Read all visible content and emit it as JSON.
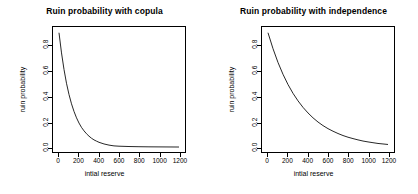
{
  "figure": {
    "background": "#ffffff",
    "line_color": "#000000",
    "axis_color": "#000000"
  },
  "chart_data": [
    {
      "type": "line",
      "title": "Ruin probability with copula",
      "xlabel": "intial reserve",
      "ylabel": "ruin probability",
      "xlim": [
        -60,
        1260
      ],
      "ylim": [
        -0.035,
        0.945
      ],
      "grid": false,
      "legend": null,
      "xticks": [
        0,
        200,
        400,
        600,
        800,
        1000,
        1200
      ],
      "xticklabels": [
        "0",
        "200",
        "400",
        "600",
        "800",
        "1000",
        "1200"
      ],
      "yticks": [
        0.0,
        0.2,
        0.4,
        0.6,
        0.8
      ],
      "yticklabels": [
        "0.0",
        "0.2",
        "0.4",
        "0.6",
        "0.8"
      ],
      "series": [
        {
          "name": "ruin probability with copula",
          "color": "#000000",
          "x": [
            0,
            25,
            50,
            75,
            100,
            125,
            150,
            175,
            200,
            225,
            250,
            275,
            300,
            325,
            350,
            375,
            400,
            450,
            500,
            550,
            600,
            700,
            800,
            900,
            1000,
            1100,
            1200
          ],
          "y": [
            0.9,
            0.742,
            0.612,
            0.504,
            0.416,
            0.343,
            0.283,
            0.233,
            0.192,
            0.158,
            0.131,
            0.108,
            0.089,
            0.073,
            0.06,
            0.05,
            0.041,
            0.028,
            0.019,
            0.013,
            0.0105,
            0.008,
            0.0065,
            0.0055,
            0.005,
            0.0045,
            0.004
          ]
        }
      ]
    },
    {
      "type": "line",
      "title": "Ruin probability with independence",
      "xlabel": "intial reserve",
      "ylabel": "ruin probability",
      "xlim": [
        -60,
        1260
      ],
      "ylim": [
        -0.035,
        0.945
      ],
      "grid": false,
      "legend": null,
      "xticks": [
        0,
        200,
        400,
        600,
        800,
        1000,
        1200
      ],
      "xticklabels": [
        "0",
        "200",
        "400",
        "600",
        "800",
        "1000",
        "1200"
      ],
      "yticks": [
        0.0,
        0.2,
        0.4,
        0.6,
        0.8
      ],
      "yticklabels": [
        "0.0",
        "0.2",
        "0.4",
        "0.6",
        "0.8"
      ],
      "series": [
        {
          "name": "ruin probability with independence",
          "color": "#000000",
          "x": [
            0,
            50,
            100,
            150,
            200,
            250,
            300,
            350,
            400,
            450,
            500,
            550,
            600,
            650,
            700,
            750,
            800,
            850,
            900,
            950,
            1000,
            1050,
            1100,
            1150,
            1200
          ],
          "y": [
            0.9,
            0.775,
            0.667,
            0.574,
            0.494,
            0.425,
            0.366,
            0.315,
            0.271,
            0.233,
            0.2,
            0.172,
            0.148,
            0.128,
            0.11,
            0.094,
            0.081,
            0.07,
            0.06,
            0.051,
            0.044,
            0.038,
            0.032,
            0.028,
            0.024
          ]
        }
      ]
    }
  ]
}
